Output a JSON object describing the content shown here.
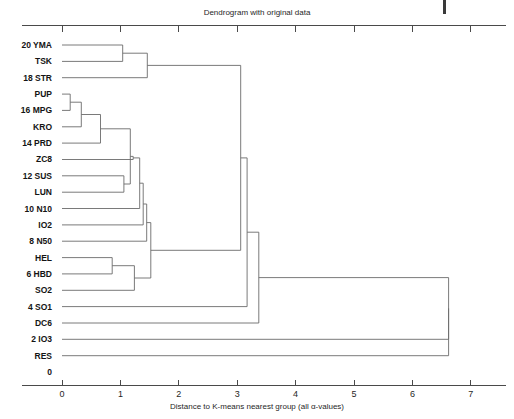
{
  "chart_data": {
    "type": "dendrogram",
    "title": "Dendrogram with original data",
    "xlabel": "Distance to K-means nearest group (all α-values)",
    "ylabel": "",
    "xlim": [
      0,
      7.75
    ],
    "xticks": [
      0,
      1,
      2,
      3,
      4,
      5,
      6,
      7
    ],
    "xticklabels": [
      "0",
      "1",
      "2",
      "3",
      "4",
      "5",
      "6",
      "7"
    ],
    "yticklabels": [
      "0",
      "2",
      "4",
      "6",
      "8",
      "10",
      "12",
      "14",
      "16",
      "18",
      "20"
    ],
    "grid": false,
    "legend": null,
    "orientation": "horizontal-left-root-right",
    "leaves": [
      {
        "index": 20,
        "tick": "20",
        "name": "YMA",
        "label": "20 YMA"
      },
      {
        "index": 19,
        "tick": "",
        "name": "TSK",
        "label": "TSK"
      },
      {
        "index": 18,
        "tick": "18",
        "name": "STR",
        "label": "18 STR"
      },
      {
        "index": 17,
        "tick": "",
        "name": "PUP",
        "label": "PUP"
      },
      {
        "index": 16,
        "tick": "16",
        "name": "MPG",
        "label": "16 MPG"
      },
      {
        "index": 15,
        "tick": "",
        "name": "KRO",
        "label": "KRO"
      },
      {
        "index": 14,
        "tick": "14",
        "name": "PRD",
        "label": "14 PRD"
      },
      {
        "index": 13,
        "tick": "",
        "name": "ZC8",
        "label": "ZC8"
      },
      {
        "index": 12,
        "tick": "12",
        "name": "SUS",
        "label": "12 SUS"
      },
      {
        "index": 11,
        "tick": "",
        "name": "LUN",
        "label": "LUN"
      },
      {
        "index": 10,
        "tick": "10",
        "name": "N10",
        "label": "10 N10"
      },
      {
        "index": 9,
        "tick": "",
        "name": "IO2",
        "label": "IO2"
      },
      {
        "index": 8,
        "tick": "8",
        "name": "N50",
        "label": "8 N50"
      },
      {
        "index": 7,
        "tick": "",
        "name": "HEL",
        "label": "HEL"
      },
      {
        "index": 6,
        "tick": "6",
        "name": "HBD",
        "label": "6 HBD"
      },
      {
        "index": 5,
        "tick": "",
        "name": "SO2",
        "label": "SO2"
      },
      {
        "index": 4,
        "tick": "4",
        "name": "SO1",
        "label": "4 SO1"
      },
      {
        "index": 3,
        "tick": "",
        "name": "DC6",
        "label": "DC6"
      },
      {
        "index": 2,
        "tick": "2",
        "name": "IO3",
        "label": "2 IO3"
      },
      {
        "index": 1,
        "tick": "",
        "name": "RES",
        "label": "RES"
      },
      {
        "index": 0,
        "tick": "0",
        "name": "",
        "label": "0"
      }
    ],
    "merges": [
      {
        "id": "m1",
        "members": [
          "YMA",
          "TSK"
        ],
        "distance": 1.04
      },
      {
        "id": "m2",
        "members": [
          "PUP",
          "MPG"
        ],
        "distance": 0.14
      },
      {
        "id": "m3",
        "members": [
          "PUP",
          "MPG",
          "KRO"
        ],
        "distance": 0.33
      },
      {
        "id": "m4",
        "members": [
          "YMA",
          "TSK",
          "STR"
        ],
        "distance": 1.46
      },
      {
        "id": "m5",
        "members": [
          "PUP",
          "MPG",
          "KRO",
          "PRD"
        ],
        "distance": 0.66
      },
      {
        "id": "m6",
        "members": [
          "HEL",
          "HBD"
        ],
        "distance": 0.86
      },
      {
        "id": "m7",
        "members": [
          "SUS",
          "LUN"
        ],
        "distance": 1.06
      },
      {
        "id": "m8",
        "members": [
          "PUP",
          "MPG",
          "KRO",
          "PRD",
          "SUS",
          "LUN"
        ],
        "distance": 1.17
      },
      {
        "id": "m9",
        "members": [
          "PUP",
          "MPG",
          "KRO",
          "PRD",
          "SUS",
          "LUN",
          "ZC8"
        ],
        "distance": 1.22
      },
      {
        "id": "m10",
        "members": [
          "HEL",
          "HBD",
          "SO2"
        ],
        "distance": 1.24
      },
      {
        "id": "m11",
        "members": [
          "PUP",
          "MPG",
          "KRO",
          "PRD",
          "SUS",
          "LUN",
          "ZC8",
          "N10"
        ],
        "distance": 1.33
      },
      {
        "id": "m12",
        "members": [
          "PUP",
          "MPG",
          "KRO",
          "PRD",
          "SUS",
          "LUN",
          "ZC8",
          "N10",
          "IO2"
        ],
        "distance": 1.39
      },
      {
        "id": "m13",
        "members": [
          "PUP",
          "MPG",
          "KRO",
          "PRD",
          "SUS",
          "LUN",
          "ZC8",
          "N10",
          "IO2",
          "N50"
        ],
        "distance": 1.45
      },
      {
        "id": "m14",
        "members": [
          "PUP",
          "MPG",
          "KRO",
          "PRD",
          "SUS",
          "LUN",
          "ZC8",
          "N10",
          "IO2",
          "N50",
          "HEL",
          "HBD",
          "SO2"
        ],
        "distance": 1.52
      },
      {
        "id": "m15",
        "members": [
          "YMA",
          "TSK",
          "STR",
          "PUP",
          "MPG",
          "KRO",
          "PRD",
          "SUS",
          "LUN",
          "ZC8",
          "N10",
          "IO2",
          "N50",
          "HEL",
          "HBD",
          "SO2"
        ],
        "distance": 3.06
      },
      {
        "id": "m16",
        "members": [
          "SO1",
          "cluster-m15"
        ],
        "distance": 3.17
      },
      {
        "id": "m17",
        "members": [
          "DC6",
          "cluster-m16"
        ],
        "distance": 3.37
      },
      {
        "id": "m18",
        "members": [
          "IO3",
          "cluster-m17"
        ],
        "distance": 6.62
      },
      {
        "id": "m19",
        "members": [
          "RES",
          "cluster-m18"
        ],
        "distance": 6.62
      }
    ]
  },
  "figure": {
    "title": "Dendrogram with original data",
    "axis_title": "Distance to K-means nearest group (all α-values)"
  }
}
